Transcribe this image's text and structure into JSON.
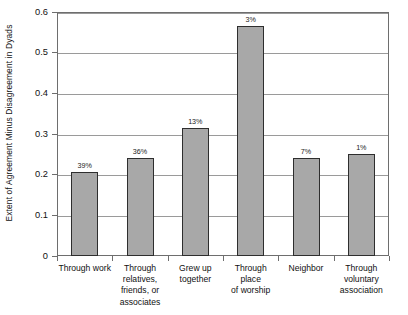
{
  "chart_data": {
    "type": "bar",
    "title": "",
    "xlabel": "",
    "ylabel": "Extent of Agreement Minus Disagreement in Dyads",
    "ylim": [
      0,
      0.6
    ],
    "yticks": [
      "0",
      "0.1",
      "0.2",
      "0.3",
      "0.4",
      "0.5",
      "0.6"
    ],
    "ytick_values": [
      0,
      0.1,
      0.2,
      0.3,
      0.4,
      0.5,
      0.6
    ],
    "grid": true,
    "legend": "none",
    "categories": [
      "Through work",
      "Through relatives, friends, or associates",
      "Grew up together",
      "Through place of worship",
      "Neighbor",
      "Through voluntary association"
    ],
    "category_lines": [
      [
        "Through work"
      ],
      [
        "Through",
        "relatives,",
        "friends, or",
        "associates"
      ],
      [
        "Grew up",
        "together"
      ],
      [
        "Through place",
        "of worship"
      ],
      [
        "Neighbor"
      ],
      [
        "Through",
        "voluntary",
        "association"
      ]
    ],
    "values": [
      0.207,
      0.24,
      0.315,
      0.565,
      0.24,
      0.251
    ],
    "point_labels": [
      "39%",
      "36%",
      "13%",
      "3%",
      "7%",
      "1%"
    ],
    "bar_fill": "#a8a8a8",
    "bar_border": "#2e2e2e",
    "gridline_color": "#9a9a9a",
    "axis_color": "#6e6e6e"
  },
  "caption": {
    "cutoff_text": ""
  }
}
